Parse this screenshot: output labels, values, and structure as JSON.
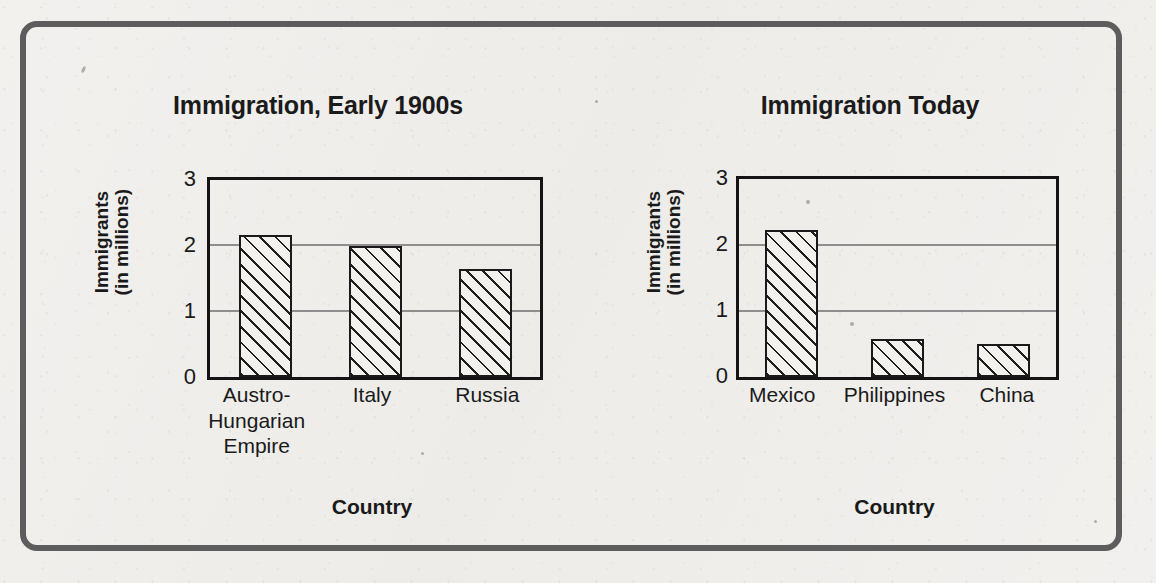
{
  "page": {
    "background_color": "#efedea",
    "frame_color": "#5d5d5d"
  },
  "chart_data": [
    {
      "type": "bar",
      "title": "Immigration, Early 1900s",
      "xlabel": "Country",
      "ylabel": "Immigrants\n(in millions)",
      "ylabel_line1": "Immigrants",
      "ylabel_line2": "(in millions)",
      "categories": [
        "Austro-\nHungarian\nEmpire",
        "Italy",
        "Russia"
      ],
      "values": [
        2.17,
        2.0,
        1.65
      ],
      "ylim": [
        0,
        3
      ],
      "yticks": [
        3,
        2,
        1,
        0
      ],
      "grid": true,
      "gridlines_at": [
        1,
        2
      ],
      "bar_fill": "diagonal-hatch"
    },
    {
      "type": "bar",
      "title": "Immigration Today",
      "xlabel": "Country",
      "ylabel": "Immigrants\n(in millions)",
      "ylabel_line1": "Immigrants",
      "ylabel_line2": "(in millions)",
      "categories": [
        "Mexico",
        "Philippines",
        "China"
      ],
      "values": [
        2.23,
        0.57,
        0.5
      ],
      "ylim": [
        0,
        3
      ],
      "yticks": [
        3,
        2,
        1,
        0
      ],
      "grid": true,
      "gridlines_at": [
        1,
        2
      ],
      "bar_fill": "diagonal-hatch"
    }
  ]
}
